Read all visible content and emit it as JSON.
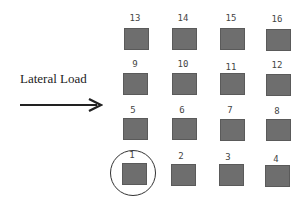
{
  "load": {
    "label": "Lateral Load",
    "direction": "right"
  },
  "colors": {
    "pile": "#6e6e6e",
    "text": "#444444",
    "arrow": "#222222"
  },
  "grid": {
    "rows": [
      [
        "13",
        "14",
        "15",
        "16"
      ],
      [
        "9",
        "10",
        "11",
        "12"
      ],
      [
        "5",
        "6",
        "7",
        "8"
      ],
      [
        "1",
        "2",
        "3",
        "4"
      ]
    ]
  },
  "highlighted": "1"
}
